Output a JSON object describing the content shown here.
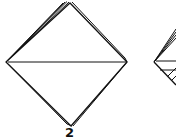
{
  "diagram": {
    "type": "origami-fold-steps",
    "steps": [
      {
        "label": "2",
        "shape": "diamond-folded-along-horizontal-diagonal"
      },
      {
        "label": "",
        "shape": "diamond-partial-cropped"
      }
    ],
    "colors": {
      "stroke": "#111111",
      "background": "#ffffff"
    }
  }
}
